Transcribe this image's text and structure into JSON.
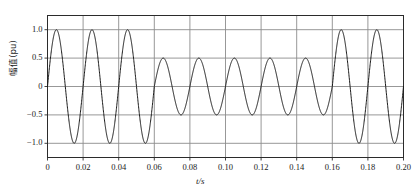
{
  "chart_data": {
    "type": "line",
    "title": "",
    "xlabel": "t/s",
    "ylabel": "幅值(pu)",
    "xlim": [
      0,
      0.2
    ],
    "ylim": [
      -1.25,
      1.25
    ],
    "grid": true,
    "legend": null,
    "legend_position": "none",
    "xticks": [
      0,
      0.02,
      0.04,
      0.06,
      0.08,
      0.1,
      0.12,
      0.14,
      0.16,
      0.18,
      0.2
    ],
    "xticklabels": [
      "0",
      "0.02",
      "0.04",
      "0.06",
      "0.08",
      "0.10",
      "0.12",
      "0.14",
      "0.16",
      "0.18",
      "0.20"
    ],
    "yticks": [
      1.0,
      0.5,
      0,
      -0.5,
      -1.0
    ],
    "yticklabels": [
      "1.0",
      "0.5",
      "0",
      "−0.5",
      "−1.0"
    ],
    "series": [
      {
        "name": "voltage-sag-waveform",
        "color": "#1a1a1a",
        "line_width": 1.0,
        "description": "Sinusoidal waveform at 50 Hz, amplitude modulated: 1.0 pu before 0.06 s, sagging to 0.5 pu between 0.06 s and 0.16 s, recovering to 1.0 pu after 0.16 s.",
        "frequency_hz": 50,
        "phase_rad": 0,
        "segments": [
          {
            "t_start": 0.0,
            "t_end": 0.06,
            "amplitude": 1.0
          },
          {
            "t_start": 0.06,
            "t_end": 0.16,
            "amplitude": 0.5
          },
          {
            "t_start": 0.16,
            "t_end": 0.2,
            "amplitude": 1.0
          }
        ],
        "peaks": [
          {
            "t": 0.005,
            "value": 1.0
          },
          {
            "t": 0.025,
            "value": 1.0
          },
          {
            "t": 0.045,
            "value": 1.0
          },
          {
            "t": 0.065,
            "value": 0.5
          },
          {
            "t": 0.085,
            "value": 0.5
          },
          {
            "t": 0.105,
            "value": 0.5
          },
          {
            "t": 0.125,
            "value": 0.5
          },
          {
            "t": 0.145,
            "value": 0.5
          },
          {
            "t": 0.165,
            "value": 1.0
          },
          {
            "t": 0.185,
            "value": 1.0
          }
        ],
        "troughs": [
          {
            "t": 0.015,
            "value": -1.0
          },
          {
            "t": 0.035,
            "value": -1.0
          },
          {
            "t": 0.055,
            "value": -1.0
          },
          {
            "t": 0.075,
            "value": -0.5
          },
          {
            "t": 0.095,
            "value": -0.5
          },
          {
            "t": 0.115,
            "value": -0.5
          },
          {
            "t": 0.135,
            "value": -0.5
          },
          {
            "t": 0.155,
            "value": -0.5
          },
          {
            "t": 0.175,
            "value": -1.0
          },
          {
            "t": 0.195,
            "value": -1.0
          }
        ]
      }
    ],
    "colors": {
      "line": "#1a1a1a",
      "grid": "#8c8c8c",
      "frame": "#2b2b2b",
      "background": "#ffffff",
      "text": "#1a1a1a"
    }
  }
}
